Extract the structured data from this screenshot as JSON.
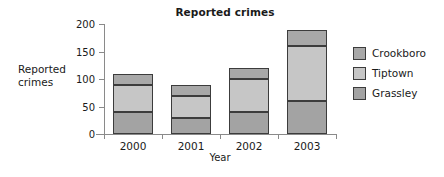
{
  "chart_data": {
    "type": "bar",
    "subtype": "stacked-bar",
    "title": "Reported crimes",
    "xlabel": "Year",
    "ylabel": "Reported crimes",
    "categories": [
      "2000",
      "2001",
      "2002",
      "2003"
    ],
    "series": [
      {
        "name": "Grassley",
        "values": [
          40,
          30,
          40,
          60
        ],
        "color": "#a3a3a3"
      },
      {
        "name": "Tiptown",
        "values": [
          50,
          40,
          60,
          100
        ],
        "color": "#c6c6c6"
      },
      {
        "name": "Crookboro",
        "values": [
          20,
          20,
          20,
          30
        ],
        "color": "#a8a8a8"
      }
    ],
    "totals": [
      110,
      90,
      120,
      190
    ],
    "stack_boundaries": {
      "2000": [
        40,
        90,
        110
      ],
      "2001": [
        30,
        70,
        90
      ],
      "2002": [
        40,
        100,
        120
      ],
      "2003": [
        60,
        160,
        190
      ]
    },
    "ylim": [
      0,
      200
    ],
    "yticks": [
      0,
      50,
      100,
      150,
      200
    ],
    "ytick_labels": [
      "0",
      "50",
      "100",
      "150",
      "200"
    ],
    "grid": false,
    "legend_position": "right",
    "legend_order": [
      "Crookboro",
      "Tiptown",
      "Grassley"
    ]
  },
  "axis": {
    "line_color": "#8a8a8a",
    "bar_outline_color": "#3c3c3c"
  },
  "legend": {
    "items": [
      {
        "label": "Crookboro",
        "color": "#a8a8a8"
      },
      {
        "label": "Tiptown",
        "color": "#c6c6c6"
      },
      {
        "label": "Grassley",
        "color": "#a3a3a3"
      }
    ]
  }
}
